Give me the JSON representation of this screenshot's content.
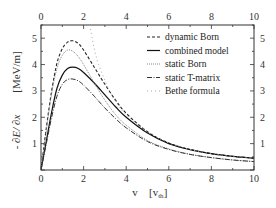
{
  "chart_data": {
    "type": "line",
    "title": "",
    "xlabel": "v   [v_th]",
    "ylabel": "- ∂E / ∂x   [MeV/m]",
    "xlim": [
      0,
      10
    ],
    "ylim": [
      0,
      5.5
    ],
    "x_ticks": [
      0,
      2,
      4,
      6,
      8,
      10
    ],
    "y_ticks": [
      1,
      2,
      3,
      4,
      5
    ],
    "grid": false,
    "legend_position": "upper right",
    "x": [
      0,
      0.25,
      0.5,
      0.75,
      1.0,
      1.25,
      1.5,
      1.75,
      2.0,
      2.5,
      3.0,
      3.5,
      4.0,
      5.0,
      6.0,
      7.0,
      8.0,
      9.0,
      10.0
    ],
    "series": [
      {
        "name": "dynamic Born",
        "style": "dashed",
        "values": [
          0,
          1.6,
          3.0,
          4.05,
          4.6,
          4.85,
          4.9,
          4.8,
          4.55,
          3.9,
          3.25,
          2.65,
          2.15,
          1.45,
          1.02,
          0.78,
          0.62,
          0.52,
          0.45
        ]
      },
      {
        "name": "combined model",
        "style": "solid",
        "values": [
          0,
          1.1,
          2.2,
          3.1,
          3.6,
          3.85,
          3.9,
          3.85,
          3.7,
          3.3,
          2.85,
          2.4,
          2.0,
          1.4,
          1.0,
          0.77,
          0.62,
          0.52,
          0.45
        ]
      },
      {
        "name": "static Born",
        "style": "dotted",
        "values": [
          0,
          1.5,
          2.9,
          3.85,
          4.35,
          4.55,
          4.5,
          4.3,
          4.0,
          3.3,
          2.65,
          2.1,
          1.7,
          1.12,
          0.8,
          0.6,
          0.47,
          0.38,
          0.32
        ]
      },
      {
        "name": "static T-matrix",
        "style": "dash-dot",
        "values": [
          0,
          1.0,
          2.0,
          2.8,
          3.25,
          3.43,
          3.45,
          3.38,
          3.22,
          2.8,
          2.35,
          1.95,
          1.6,
          1.08,
          0.78,
          0.59,
          0.47,
          0.38,
          0.32
        ]
      },
      {
        "name": "Bethe formula",
        "style": "dotted-sparse",
        "values": [
          null,
          null,
          null,
          null,
          null,
          null,
          null,
          null,
          7.0,
          4.6,
          3.4,
          2.6,
          2.1,
          1.45,
          1.03,
          0.78,
          0.62,
          0.52,
          0.45
        ]
      }
    ]
  },
  "axes": {
    "bottom_ticks": [
      "0",
      "2",
      "4",
      "6",
      "8",
      "10"
    ],
    "top_ticks": [
      "0",
      "2",
      "4",
      "6",
      "8",
      "10"
    ],
    "left_ticks": [
      "1",
      "2",
      "3",
      "4",
      "5"
    ],
    "right_ticks": [
      "1",
      "2",
      "3",
      "4",
      "5"
    ],
    "xlabel_v": "v",
    "xlabel_unit": "[v",
    "xlabel_sub": "th",
    "xlabel_close": "]",
    "ylabel_main": "- ∂E/ ∂x",
    "ylabel_unit": "[MeV/m]"
  },
  "legend": {
    "items": [
      "dynamic Born",
      "combined model",
      "static Born",
      "static T-matrix",
      "Bethe formula"
    ]
  }
}
